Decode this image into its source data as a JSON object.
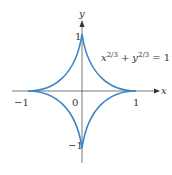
{
  "figure": {
    "equation_base_x": "x",
    "equation_exp_x": "2/3",
    "equation_plus": "+",
    "equation_base_y": "y",
    "equation_exp_y": "2/3",
    "equation_rhs": "= 1",
    "x_axis_label": "x",
    "y_axis_label": "y",
    "origin_label": "0",
    "x_ticks": [
      "−1",
      "1"
    ],
    "y_ticks": [
      "1",
      "−1"
    ],
    "curve_color": "#3a86c8",
    "axis_color": "#555555"
  }
}
